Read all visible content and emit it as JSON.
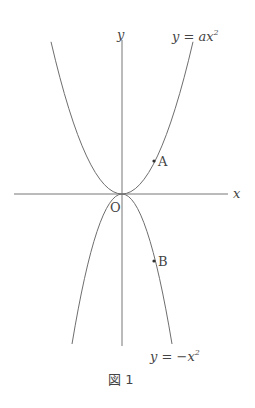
{
  "figure": {
    "caption": "図 1",
    "axes": {
      "x_label": "x",
      "y_label": "y",
      "origin_label": "O"
    },
    "curves": [
      {
        "name": "upper-parabola",
        "label_lhs": "y = ",
        "label_coef": "ax",
        "label_exp": "2",
        "equation": "y = ax^2"
      },
      {
        "name": "lower-parabola",
        "label_lhs": "y = ",
        "label_coef": "−x",
        "label_exp": "2",
        "equation": "y = -x^2"
      }
    ],
    "points": [
      {
        "label": "A",
        "on": "y = ax^2"
      },
      {
        "label": "B",
        "on": "y = -x^2"
      }
    ],
    "colors": {
      "stroke": "#6e6e6e",
      "text": "#444444"
    }
  }
}
